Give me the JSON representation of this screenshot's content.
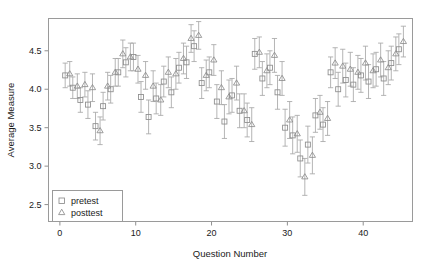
{
  "chart_data": {
    "type": "scatter",
    "title": "",
    "xlabel": "Question Number",
    "ylabel": "Average Measure",
    "xlim": [
      -1.5,
      46.5
    ],
    "ylim": [
      2.28,
      4.92
    ],
    "xticks": [
      0,
      10,
      20,
      30,
      40
    ],
    "xticklabels": [
      "0",
      "10",
      "20",
      "30",
      "40"
    ],
    "yticks": [
      2.5,
      3.0,
      3.5,
      4.0,
      4.5
    ],
    "yticklabels": [
      "2.5",
      "3.0",
      "3.5",
      "4.0",
      "4.5"
    ],
    "grid": false,
    "legend_position": "bottom-left",
    "error_bars": "vertical, capped",
    "series": [
      {
        "name": "pretest",
        "marker": "square",
        "x": [
          1,
          2,
          3,
          4,
          5,
          6,
          7,
          8,
          9,
          10,
          11,
          12,
          13,
          14,
          15,
          16,
          17,
          18,
          19,
          20,
          21,
          22,
          23,
          24,
          25,
          26,
          27,
          28,
          29,
          30,
          31,
          32,
          33,
          34,
          35,
          36,
          37,
          38,
          39,
          40,
          41,
          42,
          43,
          44,
          45
        ],
        "values": [
          4.18,
          4.02,
          3.86,
          3.8,
          3.52,
          3.78,
          4.0,
          4.22,
          4.35,
          4.42,
          3.9,
          3.64,
          3.88,
          4.1,
          3.96,
          4.28,
          4.35,
          4.56,
          4.08,
          4.22,
          3.84,
          3.58,
          3.92,
          3.72,
          3.6,
          4.46,
          4.14,
          4.28,
          3.96,
          3.5,
          3.4,
          3.1,
          3.28,
          3.66,
          3.54,
          4.22,
          4.0,
          4.12,
          4.06,
          4.18,
          4.1,
          4.26,
          4.14,
          4.34,
          4.52
        ],
        "err_low": [
          4.02,
          3.88,
          3.7,
          3.62,
          3.34,
          3.6,
          3.82,
          4.04,
          4.16,
          4.24,
          3.7,
          3.42,
          3.68,
          3.9,
          3.76,
          4.08,
          4.14,
          4.36,
          3.88,
          4.02,
          3.62,
          3.36,
          3.7,
          3.5,
          3.38,
          4.26,
          3.92,
          4.06,
          3.74,
          3.26,
          3.16,
          2.86,
          3.04,
          3.44,
          3.32,
          4.02,
          3.78,
          3.9,
          3.84,
          3.96,
          3.88,
          4.04,
          3.92,
          4.12,
          4.32
        ],
        "err_high": [
          4.34,
          4.16,
          4.02,
          3.98,
          3.7,
          3.96,
          4.18,
          4.4,
          4.54,
          4.6,
          4.1,
          3.86,
          4.08,
          4.3,
          4.16,
          4.48,
          4.56,
          4.76,
          4.28,
          4.42,
          4.06,
          3.8,
          4.14,
          3.94,
          3.82,
          4.66,
          4.36,
          4.5,
          4.18,
          3.74,
          3.64,
          3.34,
          3.52,
          3.88,
          3.76,
          4.42,
          4.22,
          4.34,
          4.28,
          4.4,
          4.32,
          4.48,
          4.36,
          4.56,
          4.72
        ]
      },
      {
        "name": "posttest",
        "marker": "triangle",
        "x": [
          1,
          2,
          3,
          4,
          5,
          6,
          7,
          8,
          9,
          10,
          11,
          12,
          13,
          14,
          15,
          16,
          17,
          18,
          19,
          20,
          21,
          22,
          23,
          24,
          25,
          26,
          27,
          28,
          29,
          30,
          31,
          32,
          33,
          34,
          35,
          36,
          37,
          38,
          39,
          40,
          41,
          42,
          43,
          44,
          45
        ],
        "values": [
          4.2,
          4.04,
          4.06,
          4.02,
          3.46,
          4.04,
          4.22,
          4.46,
          4.42,
          4.26,
          4.18,
          4.04,
          3.86,
          4.22,
          4.2,
          4.4,
          4.66,
          4.7,
          4.18,
          4.38,
          4.02,
          3.9,
          4.08,
          3.72,
          3.54,
          4.48,
          4.24,
          4.44,
          4.14,
          3.6,
          3.42,
          2.86,
          3.14,
          3.7,
          3.62,
          4.34,
          4.3,
          4.26,
          4.22,
          4.34,
          4.24,
          4.38,
          4.28,
          4.46,
          4.62
        ],
        "err_low": [
          4.04,
          3.88,
          3.9,
          3.84,
          3.28,
          3.86,
          4.04,
          4.28,
          4.24,
          4.08,
          4.0,
          3.84,
          3.66,
          4.02,
          4.0,
          4.2,
          4.48,
          4.52,
          3.98,
          4.18,
          3.8,
          3.68,
          3.86,
          3.5,
          3.32,
          4.28,
          4.02,
          4.22,
          3.92,
          3.36,
          3.18,
          2.62,
          2.9,
          3.48,
          3.4,
          4.14,
          4.08,
          4.04,
          4.0,
          4.12,
          4.02,
          4.16,
          4.06,
          4.24,
          4.42
        ],
        "err_high": [
          4.36,
          4.2,
          4.22,
          4.2,
          3.64,
          4.22,
          4.4,
          4.64,
          4.6,
          4.44,
          4.36,
          4.24,
          4.06,
          4.42,
          4.4,
          4.6,
          4.84,
          4.88,
          4.38,
          4.58,
          4.24,
          4.12,
          4.3,
          3.94,
          3.76,
          4.68,
          4.46,
          4.66,
          4.36,
          3.84,
          3.66,
          3.1,
          3.38,
          3.92,
          3.84,
          4.54,
          4.52,
          4.48,
          4.44,
          4.56,
          4.46,
          4.6,
          4.5,
          4.68,
          4.82
        ]
      }
    ]
  },
  "legend": {
    "items": [
      {
        "label": "pretest",
        "marker": "square"
      },
      {
        "label": "posttest",
        "marker": "triangle"
      }
    ]
  },
  "colors": {
    "marker": "#8c8c8c",
    "error_bar": "#a8a8a8",
    "frame": "#9a9a9a",
    "text": "#1a1a1a",
    "background": "#ffffff"
  }
}
